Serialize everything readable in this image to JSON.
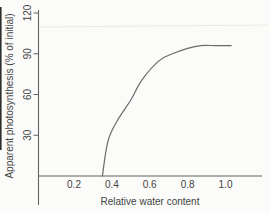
{
  "figure": {
    "background": "#fbfbf9",
    "axis_color": "#636363",
    "curve_color": "#6a6a6a",
    "text_color": "#454545",
    "scan_artifact_color": "#e9e9e5",
    "scan_edge_color": "#2f2f2f"
  },
  "chart_data": {
    "type": "line",
    "title": "",
    "xlabel": "Relative water content",
    "ylabel": "Apparent photosynthesis (% of initial)",
    "x_tick_labels": [
      "0.2",
      "0.4",
      "0.6",
      "0.8",
      "1.0"
    ],
    "x_tick_values": [
      0.2,
      0.4,
      0.6,
      0.8,
      1.0
    ],
    "y_tick_labels": [
      "120",
      "90",
      "60",
      "30"
    ],
    "y_tick_values": [
      120,
      90,
      60,
      30
    ],
    "xlim": [
      0,
      1.2
    ],
    "ylim": [
      0,
      122
    ],
    "grid": false,
    "legend": false,
    "series": [
      {
        "name": "apparent-photosynthesis-vs-relative-water-content",
        "x": [
          0.35,
          0.38,
          0.43,
          0.5,
          0.56,
          0.65,
          0.72,
          0.8,
          0.87,
          0.95,
          1.03
        ],
        "y": [
          0,
          26,
          41,
          56,
          71,
          85,
          90,
          94,
          96,
          96,
          96
        ]
      }
    ]
  }
}
